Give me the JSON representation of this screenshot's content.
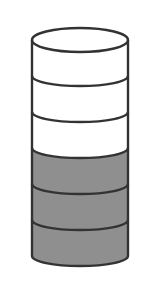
{
  "diagram": {
    "type": "stacked-cylinder",
    "total_segments": 6,
    "shaded_segments": 3,
    "unshaded_segments": 3,
    "colors": {
      "outline": "#333333",
      "shaded_fill": "#8f8f8f",
      "unshaded_fill": "#ffffff",
      "background": "#ffffff"
    },
    "geometry": {
      "cx": 80,
      "rx": 48,
      "ry": 10,
      "top_cy": 40,
      "segment_height": 36,
      "stroke_width": 2.4
    }
  }
}
